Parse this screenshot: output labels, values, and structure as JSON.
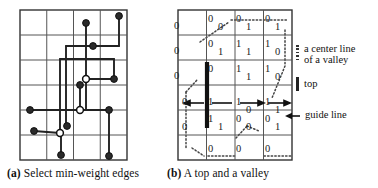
{
  "figure": {
    "panel_a": {
      "label": "(a)",
      "caption": "Select min-weight edges",
      "grid": {
        "cols": 4,
        "rows": 6,
        "x": 20,
        "y": 10,
        "w": 107,
        "h": 150
      },
      "filled_nodes": [
        {
          "x": 86,
          "y": 23
        },
        {
          "x": 119,
          "y": 16
        },
        {
          "x": 93,
          "y": 46
        },
        {
          "x": 80,
          "y": 85
        },
        {
          "x": 114,
          "y": 79
        },
        {
          "x": 30,
          "y": 110
        },
        {
          "x": 109,
          "y": 110
        },
        {
          "x": 34,
          "y": 131
        },
        {
          "x": 67,
          "y": 126
        },
        {
          "x": 61,
          "y": 155
        },
        {
          "x": 109,
          "y": 156
        }
      ],
      "open_nodes": [
        {
          "x": 86,
          "y": 79
        },
        {
          "x": 80,
          "y": 110
        },
        {
          "x": 60,
          "y": 133
        }
      ],
      "edges": [
        [
          [
            86,
            23
          ],
          [
            86,
            46
          ]
        ],
        [
          [
            119,
            16
          ],
          [
            119,
            46
          ]
        ],
        [
          [
            119,
            46
          ],
          [
            66,
            46
          ]
        ],
        [
          [
            66,
            46
          ],
          [
            66,
            126
          ]
        ],
        [
          [
            86,
            46
          ],
          [
            86,
            110
          ]
        ],
        [
          [
            60,
            59
          ],
          [
            60,
            133
          ]
        ],
        [
          [
            60,
            59
          ],
          [
            114,
            59
          ]
        ],
        [
          [
            114,
            59
          ],
          [
            114,
            79
          ]
        ],
        [
          [
            86,
            79
          ],
          [
            114,
            79
          ]
        ],
        [
          [
            30,
            110
          ],
          [
            109,
            110
          ]
        ],
        [
          [
            109,
            110
          ],
          [
            109,
            156
          ]
        ],
        [
          [
            34,
            131
          ],
          [
            60,
            133
          ]
        ],
        [
          [
            60,
            133
          ],
          [
            61,
            155
          ]
        ],
        [
          [
            80,
            85
          ],
          [
            80,
            110
          ]
        ]
      ]
    },
    "panel_b": {
      "label": "(b)",
      "caption": "A top and a valley",
      "grid": {
        "cols": 4,
        "rows": 6,
        "x": 178,
        "y": 10,
        "w": 114,
        "h": 150
      },
      "cells": [
        [
          {
            "tl": "",
            "br": ""
          },
          {
            "tl": "0",
            "br": "0"
          },
          {
            "tl": "0",
            "br": "1"
          },
          {
            "tl": "0",
            "br": "1"
          }
        ],
        [
          {
            "tl": "",
            "br": ""
          },
          {
            "tl": "0",
            "br": "1"
          },
          {
            "tl": "1",
            "br": "1"
          },
          {
            "tl": "1",
            "br": "0"
          }
        ],
        [
          {
            "tl": "",
            "br": ""
          },
          {
            "tl": "0",
            "br": ""
          },
          {
            "tl": "1",
            "br": "1"
          },
          {
            "tl": "1",
            "br": "0"
          }
        ],
        [
          {
            "tl": "",
            "br": ""
          },
          {
            "tl": "1",
            "br": ""
          },
          {
            "tl": "1",
            "br": "0"
          },
          {
            "tl": "1",
            "br": "1"
          }
        ],
        [
          {
            "tl": "",
            "br": ""
          },
          {
            "tl": "1",
            "br": "1"
          },
          {
            "tl": "0",
            "br": "0"
          },
          {
            "tl": "0",
            "br": "1"
          }
        ],
        [
          {
            "tl": "",
            "br": ""
          },
          {
            "tl": "0",
            "br": ""
          },
          {
            "tl": "0",
            "br": ""
          },
          {
            "tl": "0",
            "br": ""
          }
        ]
      ],
      "left_col_values": [
        "0",
        "0",
        "0",
        "0",
        "0",
        ""
      ],
      "top_bar": {
        "x": 207,
        "y_top": 62,
        "y_bottom": 128
      },
      "guide_arrows": [
        {
          "x1": 206,
          "y1": 110,
          "x2": 186,
          "y2": 110,
          "dir": "left"
        },
        {
          "x1": 211,
          "y1": 110,
          "x2": 264,
          "y2": 110,
          "dir": "right"
        },
        {
          "x1": 240,
          "y1": 110,
          "x2": 286,
          "y2": 110,
          "dir": "right"
        }
      ]
    },
    "legend": {
      "items": [
        {
          "glyph": "dotted-vertical-line",
          "line1": "a center line",
          "line2": "of a valley"
        },
        {
          "glyph": "thick-vertical-bar",
          "line1": "top",
          "line2": ""
        },
        {
          "glyph": "left-arrow",
          "line1": "guide line",
          "line2": ""
        }
      ]
    },
    "colors": {
      "ink": "#1a1a1a",
      "grid": "#555555",
      "node_fill": "#2a2a2a",
      "node_open": "#ffffff",
      "dotted": "#444444",
      "background": "#ffffff"
    }
  }
}
